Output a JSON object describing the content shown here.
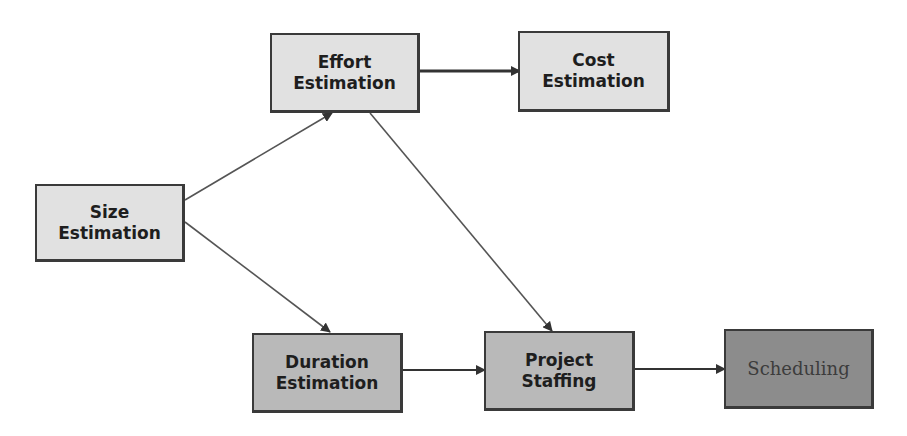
{
  "diagram": {
    "title": "",
    "nodes": [
      {
        "id": "size",
        "lines": [
          "Size",
          "Estimation"
        ],
        "shade": "light"
      },
      {
        "id": "effort",
        "lines": [
          "Effort",
          "Estimation"
        ],
        "shade": "light"
      },
      {
        "id": "cost",
        "lines": [
          "Cost",
          "Estimation"
        ],
        "shade": "light"
      },
      {
        "id": "duration",
        "lines": [
          "Duration",
          "Estimation"
        ],
        "shade": "mid"
      },
      {
        "id": "staffing",
        "lines": [
          "Project",
          "Staffing"
        ],
        "shade": "mid"
      },
      {
        "id": "scheduling",
        "lines": [
          "Scheduling"
        ],
        "shade": "dark"
      }
    ],
    "edges": [
      {
        "from": "size",
        "to": "effort"
      },
      {
        "from": "size",
        "to": "duration"
      },
      {
        "from": "effort",
        "to": "cost"
      },
      {
        "from": "effort",
        "to": "staffing"
      },
      {
        "from": "duration",
        "to": "staffing"
      },
      {
        "from": "staffing",
        "to": "scheduling"
      }
    ],
    "colors": {
      "light_fill": "#e1e1e1",
      "mid_fill": "#b9b9b9",
      "dark_fill": "#8c8c8c",
      "border": "#3a3a3a",
      "edge": "#444444"
    }
  }
}
